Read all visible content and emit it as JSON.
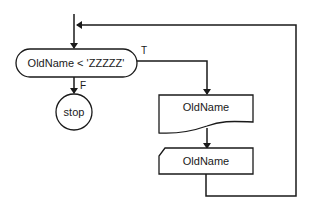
{
  "diagram": {
    "type": "flowchart",
    "stroke_color": "#1a1a1a",
    "background": "#ffffff",
    "nodes": [
      {
        "id": "decision",
        "shape": "terminal-pill",
        "label": "OldName < 'ZZZZZ'"
      },
      {
        "id": "stop",
        "shape": "circle",
        "label": "stop"
      },
      {
        "id": "output",
        "shape": "document",
        "label": "OldName"
      },
      {
        "id": "input",
        "shape": "manual-input",
        "label": "OldName"
      }
    ],
    "edges": [
      {
        "from": "entry",
        "to": "decision",
        "label": ""
      },
      {
        "from": "decision",
        "to": "stop",
        "label": "F"
      },
      {
        "from": "decision",
        "to": "output",
        "label": "T"
      },
      {
        "from": "output",
        "to": "input",
        "label": ""
      },
      {
        "from": "input",
        "to": "decision",
        "label": "loop back"
      }
    ],
    "labels": {
      "decision": "OldName < 'ZZZZZ'",
      "true_branch": "T",
      "false_branch": "F",
      "stop": "stop",
      "document": "OldName",
      "manual_input": "OldName"
    }
  }
}
